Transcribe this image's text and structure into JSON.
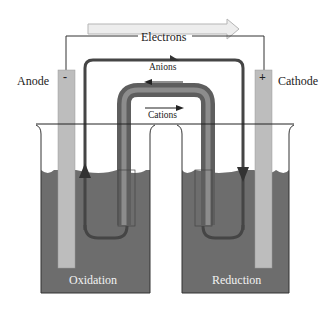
{
  "diagram": {
    "type": "galvanic-cell",
    "labels": {
      "electrons": "Electrons",
      "anions": "Anions",
      "cations": "Cations",
      "anode": "Anode",
      "cathode": "Cathode",
      "anode_sign": "-",
      "cathode_sign": "+",
      "oxidation": "Oxidation",
      "reduction": "Reduction"
    },
    "colors": {
      "solution": "#6d6d6d",
      "electrode": "#bdbdbd",
      "circuit_loop": "#454545",
      "salt_bridge_outer": "#5e5e5e",
      "salt_bridge_inner": "#8c8c8c",
      "electron_arrow_fill": "#ededed",
      "wire": "#333333"
    },
    "arrows": {
      "electrons": "left-to-right",
      "anions": "right-to-left",
      "cations": "left-to-right",
      "loop_left": "up",
      "loop_right": "down"
    }
  }
}
